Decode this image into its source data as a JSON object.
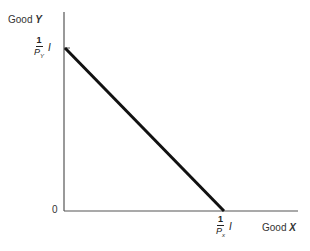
{
  "diagram": {
    "type": "budget-line",
    "y_axis": {
      "label_prefix": "Good",
      "label_var": "Y"
    },
    "x_axis": {
      "label_prefix": "Good",
      "label_var": "X"
    },
    "origin_label": "0",
    "y_intercept": {
      "numerator": "1",
      "denominator_var": "P",
      "denominator_sub": "Y",
      "multiplier": "I"
    },
    "x_intercept": {
      "numerator": "1",
      "denominator_var": "P",
      "denominator_sub": "x",
      "multiplier": "I"
    },
    "colors": {
      "axis": "#555555",
      "line": "#111111",
      "text": "#333333"
    }
  }
}
